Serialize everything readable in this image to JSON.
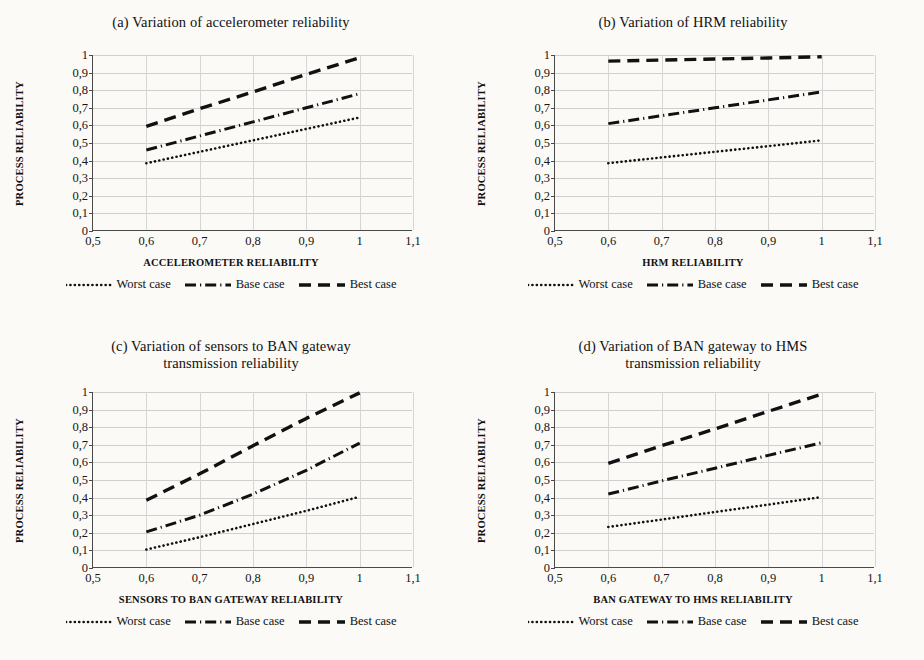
{
  "figure": {
    "background": "#fbfaf7",
    "ink": "#111111",
    "gridcolor": "#cfcfcf"
  },
  "legend_labels": {
    "worst": "Worst case",
    "base": "Base case",
    "best": "Best case"
  },
  "axis": {
    "y_title": "PROCESS RELIABILITY",
    "y_ticks": [
      "0",
      "0,1",
      "0,2",
      "0,3",
      "0,4",
      "0,5",
      "0,6",
      "0,7",
      "0,8",
      "0,9",
      "1"
    ],
    "x_ticks": [
      "0,5",
      "0,6",
      "0,7",
      "0,8",
      "0,9",
      "1",
      "1,1"
    ]
  },
  "panels": [
    {
      "id": "a",
      "title": "(a) Variation of accelerometer reliability",
      "title_lines": [
        "(a) Variation of accelerometer reliability"
      ],
      "x_title": "ACCELEROMETER RELIABILITY"
    },
    {
      "id": "b",
      "title": "(b) Variation of HRM reliability",
      "title_lines": [
        "(b) Variation of HRM reliability"
      ],
      "x_title": "HRM RELIABILITY"
    },
    {
      "id": "c",
      "title": "(c) Variation of sensors to BAN gateway transmission reliability",
      "title_lines": [
        "(c) Variation of sensors to BAN gateway",
        "transmission reliability"
      ],
      "x_title": "SENSORS TO BAN GATEWAY RELIABILITY"
    },
    {
      "id": "d",
      "title": "(d) Variation of BAN gateway to HMS transmission reliability",
      "title_lines": [
        "(d) Variation of BAN gateway to HMS",
        "transmission reliability"
      ],
      "x_title": "BAN GATEWAY TO HMS RELIABILITY"
    }
  ],
  "chart_data": [
    {
      "type": "line",
      "panel": "a",
      "title": "(a) Variation of accelerometer reliability",
      "xlabel": "ACCELEROMETER RELIABILITY",
      "ylabel": "PROCESS RELIABILITY",
      "xlim": [
        0.5,
        1.1
      ],
      "ylim": [
        0,
        1
      ],
      "grid": true,
      "legend_position": "bottom",
      "x": [
        0.6,
        0.7,
        0.8,
        0.9,
        1.0
      ],
      "series": [
        {
          "name": "Worst case",
          "style": "dotted",
          "values": [
            0.385,
            0.45,
            0.515,
            0.58,
            0.645
          ]
        },
        {
          "name": "Base case",
          "style": "dashdot",
          "values": [
            0.46,
            0.54,
            0.62,
            0.7,
            0.78
          ]
        },
        {
          "name": "Best case",
          "style": "dashed",
          "values": [
            0.595,
            0.695,
            0.79,
            0.89,
            0.985
          ]
        }
      ]
    },
    {
      "type": "line",
      "panel": "b",
      "title": "(b) Variation of HRM reliability",
      "xlabel": "HRM RELIABILITY",
      "ylabel": "PROCESS RELIABILITY",
      "xlim": [
        0.5,
        1.1
      ],
      "ylim": [
        0,
        1
      ],
      "grid": true,
      "legend_position": "bottom",
      "x": [
        0.6,
        0.7,
        0.8,
        0.9,
        1.0
      ],
      "series": [
        {
          "name": "Worst case",
          "style": "dotted",
          "values": [
            0.385,
            0.418,
            0.45,
            0.482,
            0.515
          ]
        },
        {
          "name": "Base case",
          "style": "dashdot",
          "values": [
            0.61,
            0.655,
            0.7,
            0.745,
            0.79
          ]
        },
        {
          "name": "Best case",
          "style": "dashed",
          "values": [
            0.965,
            0.971,
            0.977,
            0.983,
            0.99
          ]
        }
      ]
    },
    {
      "type": "line",
      "panel": "c",
      "title": "(c) Variation of sensors to BAN gateway transmission reliability",
      "xlabel": "SENSORS TO BAN GATEWAY RELIABILITY",
      "ylabel": "PROCESS RELIABILITY",
      "xlim": [
        0.5,
        1.1
      ],
      "ylim": [
        0,
        1
      ],
      "grid": true,
      "legend_position": "bottom",
      "x": [
        0.6,
        0.7,
        0.8,
        0.9,
        1.0
      ],
      "series": [
        {
          "name": "Worst case",
          "style": "dotted",
          "values": [
            0.105,
            0.175,
            0.25,
            0.325,
            0.405
          ]
        },
        {
          "name": "Base case",
          "style": "dashdot",
          "values": [
            0.205,
            0.3,
            0.42,
            0.555,
            0.71
          ]
        },
        {
          "name": "Best case",
          "style": "dashed",
          "values": [
            0.385,
            0.535,
            0.695,
            0.85,
            0.995
          ]
        }
      ]
    },
    {
      "type": "line",
      "panel": "d",
      "title": "(d) Variation of BAN gateway to HMS transmission reliability",
      "xlabel": "BAN GATEWAY TO HMS RELIABILITY",
      "ylabel": "PROCESS RELIABILITY",
      "xlim": [
        0.5,
        1.1
      ],
      "ylim": [
        0,
        1
      ],
      "grid": true,
      "legend_position": "bottom",
      "x": [
        0.6,
        0.7,
        0.8,
        0.9,
        1.0
      ],
      "series": [
        {
          "name": "Worst case",
          "style": "dotted",
          "values": [
            0.233,
            0.275,
            0.318,
            0.36,
            0.403
          ]
        },
        {
          "name": "Base case",
          "style": "dashdot",
          "values": [
            0.42,
            0.495,
            0.567,
            0.64,
            0.712
          ]
        },
        {
          "name": "Best case",
          "style": "dashed",
          "values": [
            0.595,
            0.695,
            0.79,
            0.89,
            0.988
          ]
        }
      ]
    }
  ]
}
